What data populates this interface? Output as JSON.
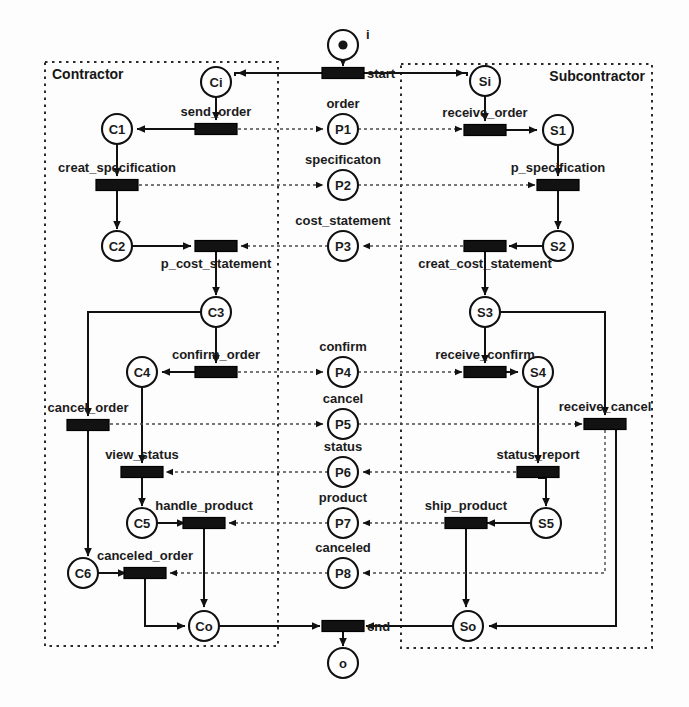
{
  "diagram": {
    "type": "petri-net",
    "containers": [
      {
        "id": "contractor",
        "label": "Contractor",
        "x": 45,
        "y": 62,
        "w": 233,
        "h": 584
      },
      {
        "id": "subcontractor",
        "label": "Subcontractor",
        "x": 401,
        "y": 64,
        "w": 251,
        "h": 584
      }
    ],
    "places": [
      {
        "id": "i",
        "label": "i",
        "name_pos": "right",
        "x": 343,
        "y": 45,
        "r": 15,
        "token": true
      },
      {
        "id": "Ci",
        "label": "Ci",
        "x": 216,
        "y": 82,
        "r": 15,
        "token": false
      },
      {
        "id": "C1",
        "label": "C1",
        "x": 117,
        "y": 129,
        "r": 15,
        "token": false
      },
      {
        "id": "C2",
        "label": "C2",
        "x": 117,
        "y": 246,
        "r": 15,
        "token": false
      },
      {
        "id": "C3",
        "label": "C3",
        "x": 216,
        "y": 312,
        "r": 15,
        "token": false
      },
      {
        "id": "C4",
        "label": "C4",
        "x": 142,
        "y": 372,
        "r": 15,
        "token": false
      },
      {
        "id": "C5",
        "label": "C5",
        "x": 142,
        "y": 523,
        "r": 15,
        "token": false
      },
      {
        "id": "C6",
        "label": "C6",
        "x": 83,
        "y": 573,
        "r": 15,
        "token": false
      },
      {
        "id": "Co",
        "label": "Co",
        "x": 204,
        "y": 626,
        "r": 15,
        "token": false
      },
      {
        "id": "P1",
        "label": "P1",
        "x": 343,
        "y": 129,
        "r": 15,
        "token": false
      },
      {
        "id": "P2",
        "label": "P2",
        "x": 343,
        "y": 185,
        "r": 15,
        "token": false
      },
      {
        "id": "P3",
        "label": "P3",
        "x": 343,
        "y": 246,
        "r": 15,
        "token": false
      },
      {
        "id": "P4",
        "label": "P4",
        "x": 343,
        "y": 372,
        "r": 15,
        "token": false
      },
      {
        "id": "P5",
        "label": "P5",
        "x": 343,
        "y": 424,
        "r": 15,
        "token": false
      },
      {
        "id": "P6",
        "label": "P6",
        "x": 343,
        "y": 472,
        "r": 15,
        "token": false
      },
      {
        "id": "P7",
        "label": "P7",
        "x": 343,
        "y": 523,
        "r": 15,
        "token": false
      },
      {
        "id": "P8",
        "label": "P8",
        "x": 343,
        "y": 573,
        "r": 15,
        "token": false
      },
      {
        "id": "Si",
        "label": "Si",
        "x": 485,
        "y": 81,
        "r": 15,
        "token": false
      },
      {
        "id": "S1",
        "label": "S1",
        "x": 558,
        "y": 130,
        "r": 15,
        "token": false
      },
      {
        "id": "S2",
        "label": "S2",
        "x": 558,
        "y": 246,
        "r": 15,
        "token": false
      },
      {
        "id": "S3",
        "label": "S3",
        "x": 485,
        "y": 312,
        "r": 15,
        "token": false
      },
      {
        "id": "S4",
        "label": "S4",
        "x": 538,
        "y": 372,
        "r": 15,
        "token": false
      },
      {
        "id": "S5",
        "label": "S5",
        "x": 546,
        "y": 523,
        "r": 15,
        "token": false
      },
      {
        "id": "So",
        "label": "So",
        "x": 468,
        "y": 626,
        "r": 15,
        "token": false
      },
      {
        "id": "o",
        "label": "o",
        "x": 343,
        "y": 663,
        "r": 15,
        "token": false
      }
    ],
    "transitions": [
      {
        "id": "t_start",
        "label": "start",
        "label_pos": "right",
        "x": 343,
        "y": 73,
        "w": 42,
        "h": 11
      },
      {
        "id": "t_send_order",
        "label": "send_order",
        "label_pos": "above",
        "x": 216,
        "y": 129,
        "w": 42,
        "h": 11
      },
      {
        "id": "t_creat_specification",
        "label": "creat_specification",
        "label_pos": "above",
        "x": 117,
        "y": 185,
        "w": 42,
        "h": 11
      },
      {
        "id": "t_p_cost_statement",
        "label": "p_cost_statement",
        "label_pos": "below",
        "x": 216,
        "y": 246,
        "w": 42,
        "h": 11
      },
      {
        "id": "t_confirm_order",
        "label": "confirm_order",
        "label_pos": "above",
        "x": 216,
        "y": 372,
        "w": 42,
        "h": 11
      },
      {
        "id": "t_cancel_order",
        "label": "cancel_order",
        "label_pos": "above",
        "x": 88,
        "y": 425,
        "w": 42,
        "h": 11
      },
      {
        "id": "t_view_status",
        "label": "view_status",
        "label_pos": "above",
        "x": 142,
        "y": 472,
        "w": 42,
        "h": 11
      },
      {
        "id": "t_handle_product",
        "label": "handle_product",
        "label_pos": "above",
        "x": 204,
        "y": 523,
        "w": 42,
        "h": 11
      },
      {
        "id": "t_canceled_order",
        "label": "canceled_order",
        "label_pos": "above",
        "x": 145,
        "y": 573,
        "w": 42,
        "h": 11
      },
      {
        "id": "t_end",
        "label": "end",
        "label_pos": "right",
        "x": 343,
        "y": 626,
        "w": 42,
        "h": 11
      },
      {
        "id": "t_receive_order",
        "label": "receive_order",
        "label_pos": "above",
        "x": 485,
        "y": 130,
        "w": 42,
        "h": 11
      },
      {
        "id": "t_p_specification",
        "label": "p_specification",
        "label_pos": "above",
        "x": 558,
        "y": 185,
        "w": 42,
        "h": 11
      },
      {
        "id": "t_creat_cost_statement",
        "label": "creat_cost_statement",
        "label_pos": "below",
        "x": 485,
        "y": 246,
        "w": 42,
        "h": 11
      },
      {
        "id": "t_receive_confirm",
        "label": "receive_confirm",
        "label_pos": "above",
        "x": 485,
        "y": 372,
        "w": 42,
        "h": 11
      },
      {
        "id": "t_receive_cancel",
        "label": "receive_cancel",
        "label_pos": "above",
        "x": 605,
        "y": 424,
        "w": 42,
        "h": 11
      },
      {
        "id": "t_status_report",
        "label": "status_report",
        "label_pos": "above",
        "x": 538,
        "y": 472,
        "w": 42,
        "h": 11
      },
      {
        "id": "t_ship_product",
        "label": "ship_product",
        "label_pos": "above",
        "x": 466,
        "y": 523,
        "w": 42,
        "h": 11
      }
    ],
    "place_captions": [
      {
        "for": "P1",
        "text": "order"
      },
      {
        "for": "P2",
        "text": "specificaton"
      },
      {
        "for": "P3",
        "text": "cost_statement"
      },
      {
        "for": "P4",
        "text": "confirm"
      },
      {
        "for": "P5",
        "text": "cancel"
      },
      {
        "for": "P6",
        "text": "status"
      },
      {
        "for": "P7",
        "text": "product"
      },
      {
        "for": "P8",
        "text": "canceled"
      }
    ],
    "colors": {
      "stroke": "#111111",
      "transition_fill": "#121212",
      "place_fill": "#ffffff",
      "message_arc": "#4a4a4a",
      "background": "#fdfdfd"
    }
  }
}
